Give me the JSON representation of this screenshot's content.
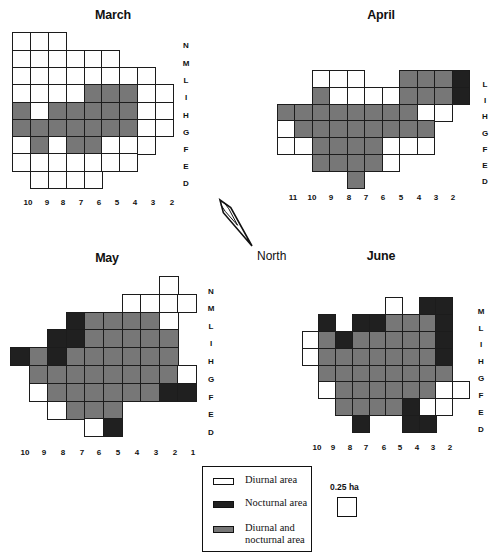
{
  "figure": {
    "north_label": "North",
    "north_arrow": {
      "tip": [
        220,
        200
      ],
      "tail": [
        252,
        246
      ]
    },
    "colors": {
      "diurnal": "#ffffff",
      "nocturnal": "#202020",
      "both": "#777777",
      "grid_line": "#1c1c1c"
    },
    "legend": {
      "items": [
        {
          "key": "w",
          "label": "Diurnal area"
        },
        {
          "key": "b",
          "label": "Nocturnal area"
        },
        {
          "key": "g",
          "label": "Diurnal and nocturnal area"
        }
      ],
      "scale_label": "0.25 ha"
    },
    "panels": [
      {
        "title": "March",
        "title_pos": [
          113,
          15
        ],
        "origin": [
          12.3,
          32.3
        ],
        "cell_w": 17.8,
        "cell_h": 17.3,
        "row_labels": [
          "N",
          "M",
          "L",
          "I",
          "H",
          "G",
          "F",
          "E",
          "D"
        ],
        "row_label_x": 186,
        "row_label_y": [
          45,
          63,
          80,
          97,
          115,
          132,
          149,
          166,
          183
        ],
        "col_labels": [
          "10",
          "9",
          "8",
          "7",
          "6",
          "5",
          "4",
          "3",
          "2"
        ],
        "col_label_x": [
          28,
          47,
          63,
          81,
          99,
          117,
          135,
          153,
          172
        ],
        "col_label_y": 202,
        "grid": [
          "www......",
          "wwwwww...",
          "wwwwwwww.",
          "wwwwgggww",
          "gwgggggww",
          "gggggggww",
          "wgwggwww.",
          "wwwwwww..",
          ".wwww...."
        ]
      },
      {
        "title": "April",
        "title_pos": [
          381,
          15
        ],
        "origin": [
          276.7,
          70.3
        ],
        "cell_w": 17.5,
        "cell_h": 16.7,
        "row_labels": [
          "L",
          "I",
          "H",
          "G",
          "F",
          "E",
          "D"
        ],
        "row_label_x": 485,
        "row_label_y": [
          84,
          100,
          116,
          133,
          149,
          165,
          181
        ],
        "col_labels": [
          "11",
          "10",
          "9",
          "8",
          "7",
          "6",
          "5",
          "4",
          "3",
          "2"
        ],
        "col_label_x": [
          293,
          312,
          331,
          349,
          366,
          383,
          401,
          419,
          436,
          453
        ],
        "col_label_y": 197,
        "grid": [
          "..www..gggb",
          "..gwwwwgggb",
          "ggggggggww.",
          "wgggggggg..",
          "wwggggwww..",
          "..ggggw....",
          "....g......"
        ]
      },
      {
        "title": "May",
        "title_pos": [
          107,
          258
        ],
        "origin": [
          10,
          276
        ],
        "cell_w": 18.6,
        "cell_h": 17.8,
        "row_labels": [
          "N",
          "M",
          "L",
          "I",
          "H",
          "G",
          "F",
          "E",
          "D"
        ],
        "row_label_x": 211,
        "row_label_y": [
          291,
          308,
          326,
          343,
          361,
          379,
          397,
          414,
          432
        ],
        "col_labels": [
          "10",
          "9",
          "8",
          "7",
          "6",
          "5",
          "4",
          "3",
          "2",
          "1"
        ],
        "col_label_x": [
          25,
          44,
          63,
          82,
          99,
          118,
          137,
          156,
          175,
          193
        ],
        "col_label_y": 452,
        "grid": [
          "........w.",
          "......wwww",
          "...bggggw.",
          "..bbggggg.",
          "bgbgggggg.",
          ".ggggggggw",
          ".wggggggbb",
          "..wggg....",
          "....wb...."
        ]
      },
      {
        "title": "June",
        "title_pos": [
          381,
          256
        ],
        "origin": [
          301.7,
          297.3
        ],
        "cell_w": 16.7,
        "cell_h": 16.8,
        "row_labels": [
          "M",
          "L",
          "I",
          "H",
          "G",
          "F",
          "E",
          "D"
        ],
        "row_label_x": 481,
        "row_label_y": [
          311,
          328,
          344,
          361,
          378,
          395,
          412,
          429
        ],
        "col_labels": [
          "10",
          "9",
          "8",
          "7",
          "6",
          "5",
          "4",
          "3",
          "2"
        ],
        "col_label_x": [
          317,
          333,
          350,
          366,
          384,
          400,
          417,
          433,
          450
        ],
        "col_label_y": 447,
        "grid": [
          ".....w.bb.",
          ".b.bbgggb.",
          "wgbgggggb.",
          "wgggggggb.",
          ".gggggggg.",
          ".wggggggww",
          "..ggggbww.",
          "...b..bb.."
        ]
      }
    ]
  }
}
